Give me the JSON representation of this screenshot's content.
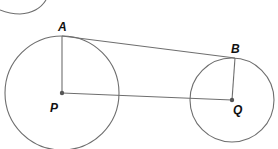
{
  "diagram": {
    "type": "geometry",
    "colors": {
      "stroke": "#6e6e6e",
      "point": "#555555",
      "label": "#111111",
      "background": "#ffffff"
    },
    "points": {
      "A": {
        "label": "A",
        "x": 62,
        "y": 36
      },
      "B": {
        "label": "B",
        "x": 235,
        "y": 58
      },
      "P": {
        "label": "P",
        "x": 62,
        "y": 93
      },
      "Q": {
        "label": "Q",
        "x": 232,
        "y": 100
      }
    },
    "circles": [
      {
        "name": "circle-P",
        "center": "P",
        "radius": 58
      },
      {
        "name": "circle-Q",
        "center": "Q",
        "radius": 42
      },
      {
        "name": "partial-circle-top-left",
        "center": "offscreen",
        "radius": 40
      }
    ],
    "segments": [
      {
        "from": "A",
        "to": "B",
        "description": "common tangent"
      },
      {
        "from": "A",
        "to": "P",
        "description": "radius PA"
      },
      {
        "from": "B",
        "to": "Q",
        "description": "radius QB"
      },
      {
        "from": "P",
        "to": "Q",
        "description": "line of centres"
      }
    ]
  }
}
